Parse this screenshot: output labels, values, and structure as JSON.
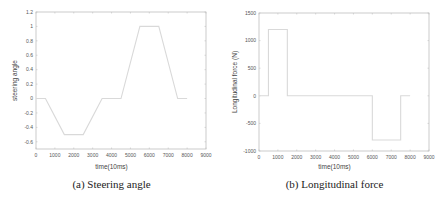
{
  "figure": {
    "panel_a": {
      "caption": "(a) Steering angle",
      "xlabel": "time(10ms)",
      "ylabel": "steering angle",
      "line_color": "#d9d9d9",
      "axis_color": "#bfbfbf"
    },
    "panel_b": {
      "caption": "(b) Longitudinal force",
      "xlabel": "time(10ms)",
      "ylabel": "Longitudinal force (N)",
      "line_color": "#d9d9d9",
      "axis_color": "#bfbfbf"
    }
  },
  "chart_data": [
    {
      "type": "line",
      "title": "(a) Steering angle",
      "xlabel": "time(10ms)",
      "ylabel": "steering angle",
      "xlim": [
        0,
        9000
      ],
      "ylim": [
        -0.7,
        1.2
      ],
      "xticks": [
        0,
        1000,
        2000,
        3000,
        4000,
        5000,
        6000,
        7000,
        8000,
        9000
      ],
      "yticks": [
        -0.6,
        -0.4,
        -0.2,
        0,
        0.2,
        0.4,
        0.6,
        0.8,
        1,
        1.2
      ],
      "ytick_labels": [
        "-0.6",
        "-0.4",
        "-0.2",
        "0",
        "0.2",
        "0.4",
        "0.6",
        "0.8",
        "1",
        "1.2"
      ],
      "grid": false,
      "series": [
        {
          "name": "steering angle",
          "x": [
            0,
            500,
            1500,
            2500,
            3500,
            4500,
            5500,
            6500,
            7500,
            8000
          ],
          "y": [
            0,
            0,
            -0.5,
            -0.5,
            0,
            0,
            1,
            1,
            0,
            0
          ]
        }
      ]
    },
    {
      "type": "line",
      "title": "(b) Longitudinal force",
      "xlabel": "time(10ms)",
      "ylabel": "Longitudinal force (N)",
      "xlim": [
        0,
        9000
      ],
      "ylim": [
        -1000,
        1500
      ],
      "xticks": [
        0,
        1000,
        2000,
        3000,
        4000,
        5000,
        6000,
        7000,
        8000,
        9000
      ],
      "yticks": [
        -1000,
        -500,
        0,
        500,
        1000,
        1500
      ],
      "ytick_labels": [
        "-1000",
        "-500",
        "0",
        "500",
        "1000",
        "1500"
      ],
      "grid": false,
      "series": [
        {
          "name": "Longitudinal force",
          "x": [
            0,
            500,
            500,
            1500,
            1500,
            6000,
            6000,
            7500,
            7500,
            8000
          ],
          "y": [
            0,
            0,
            1200,
            1200,
            0,
            0,
            -800,
            -800,
            0,
            0
          ]
        }
      ]
    }
  ]
}
